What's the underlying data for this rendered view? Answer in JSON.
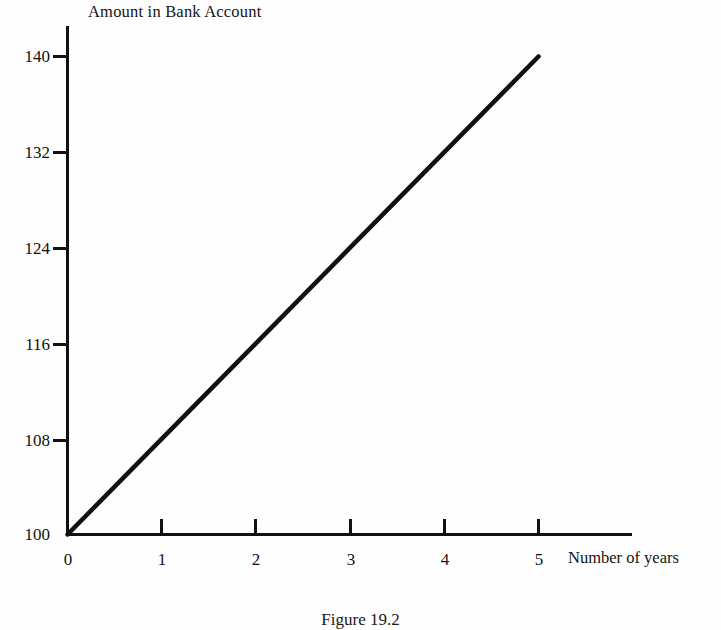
{
  "chart_data": {
    "type": "line",
    "title": "Amount in Bank Account",
    "xlabel": "Number of years",
    "ylabel": "",
    "x": [
      0,
      1,
      2,
      3,
      4,
      5
    ],
    "values": [
      100,
      108,
      116,
      124,
      132,
      140
    ],
    "series": [
      {
        "name": "Amount in Bank Account",
        "values": [
          100,
          108,
          116,
          124,
          132,
          140
        ]
      }
    ],
    "xlim": [
      0,
      5
    ],
    "ylim": [
      100,
      140
    ],
    "xticks": [
      "0",
      "1",
      "2",
      "3",
      "4",
      "5"
    ],
    "yticks": [
      "100",
      "108",
      "116",
      "124",
      "132",
      "140"
    ],
    "grid": false,
    "legend": false,
    "line_color": "#111111"
  },
  "caption": {
    "text": "Figure 19.2"
  }
}
